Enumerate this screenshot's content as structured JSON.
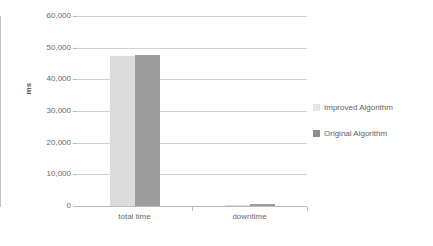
{
  "chart_data": {
    "type": "bar",
    "title": "",
    "xlabel": "",
    "ylabel": "ms",
    "categories": [
      "total time",
      "downtime"
    ],
    "series": [
      {
        "name": "Improved Algorithm",
        "color": "#dcdcdc",
        "values": [
          47300,
          400
        ]
      },
      {
        "name": "Original Algorithm",
        "color": "#9d9d9d",
        "values": [
          47800,
          600
        ]
      }
    ],
    "ylim": [
      0,
      60000
    ],
    "ytick_labels": [
      "60,000",
      "50,000",
      "40,000",
      "30,000",
      "20,000",
      "10,000",
      "0"
    ],
    "ytick_values": [
      60000,
      50000,
      40000,
      30000,
      20000,
      10000,
      0
    ],
    "grid": true,
    "legend_position": "right"
  },
  "legend": {
    "entries": [
      {
        "label": "Improved Algorithm"
      },
      {
        "label": "Original Algorithm"
      }
    ]
  },
  "colors": {
    "series_improved": "#dcdcdc",
    "series_original": "#9d9d9d",
    "gridline": "#d2d2d2",
    "axis": "#bdbdbd",
    "text": "#6a6a6a"
  }
}
